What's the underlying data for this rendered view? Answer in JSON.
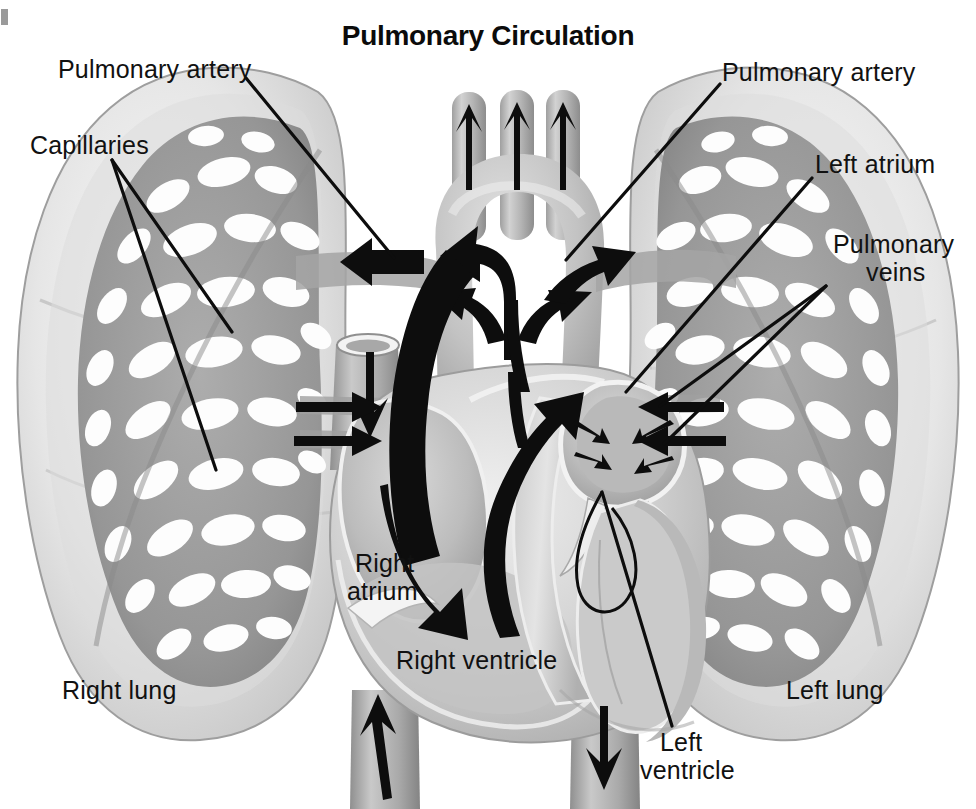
{
  "figure": {
    "title": "Pulmonary Circulation",
    "type": "anatomical-illustration",
    "style": "grayscale airbrush medical illustration",
    "background_color": "#ffffff",
    "ink_color": "#111111"
  },
  "labels": {
    "pulmonary_artery_left": "Pulmonary artery",
    "capillaries": "Capillaries",
    "right_lung": "Right lung",
    "right_atrium_line1": "Right",
    "right_atrium_line2": "atrium",
    "right_ventricle": "Right ventricle",
    "pulmonary_artery_right": "Pulmonary artery",
    "left_atrium": "Left atrium",
    "pulmonary_veins_line1": "Pulmonary",
    "pulmonary_veins_line2": "veins",
    "left_lung": "Left lung",
    "left_ventricle_line1": "Left",
    "left_ventricle_line2": "ventricle"
  },
  "structures": {
    "aortic_arch": "aortic arch",
    "brachiocephalic_branches": "three aortic arch branch vessels",
    "superior_vena_cava": "superior vena cava",
    "inferior_vena_cava": "inferior vena cava",
    "descending_aorta": "descending aorta",
    "pulmonary_trunk": "pulmonary trunk",
    "interventricular_septum": "interventricular septum",
    "right_lung_capillary_bed": "right lung capillary network",
    "left_lung_capillary_bed": "left lung capillary network"
  },
  "flow_arrows": [
    {
      "name": "aortic-branch-arrow-1",
      "direction": "up",
      "meaning": "blood to head and arms"
    },
    {
      "name": "aortic-branch-arrow-2",
      "direction": "up",
      "meaning": "blood to head and arms"
    },
    {
      "name": "aortic-branch-arrow-3",
      "direction": "up",
      "meaning": "blood to head and arms"
    },
    {
      "name": "superior-vena-cava-arrow",
      "direction": "down",
      "meaning": "deoxygenated blood into right atrium"
    },
    {
      "name": "inferior-vena-cava-arrow",
      "direction": "up",
      "meaning": "deoxygenated blood into right atrium"
    },
    {
      "name": "descending-aorta-arrow",
      "direction": "down",
      "meaning": "oxygenated blood to body"
    },
    {
      "name": "right-atrium-arrow",
      "direction": "down-right",
      "meaning": "right atrium to right ventricle"
    },
    {
      "name": "right-ventricle-outflow-arrow",
      "direction": "up",
      "meaning": "right ventricle to pulmonary trunk"
    },
    {
      "name": "pulmonary-trunk-split-arrow",
      "direction": "y-split",
      "meaning": "pulmonary trunk branching to both lungs"
    },
    {
      "name": "right-pulmonary-artery-arrow",
      "direction": "left",
      "meaning": "to right lung"
    },
    {
      "name": "left-pulmonary-artery-arrow",
      "direction": "up-right",
      "meaning": "to left lung"
    },
    {
      "name": "pulmonary-vein-arrow-right-upper",
      "direction": "right",
      "meaning": "oxygenated blood from right lung"
    },
    {
      "name": "pulmonary-vein-arrow-right-lower",
      "direction": "right",
      "meaning": "oxygenated blood from right lung"
    },
    {
      "name": "pulmonary-vein-arrow-left-upper",
      "direction": "left",
      "meaning": "oxygenated blood from left lung"
    },
    {
      "name": "pulmonary-vein-arrow-left-lower",
      "direction": "left",
      "meaning": "oxygenated blood from left lung"
    },
    {
      "name": "left-atrium-converging-arrow-1",
      "direction": "inward",
      "meaning": "into left atrium"
    },
    {
      "name": "left-atrium-converging-arrow-2",
      "direction": "inward",
      "meaning": "into left atrium"
    },
    {
      "name": "left-atrium-converging-arrow-3",
      "direction": "inward",
      "meaning": "into left atrium"
    },
    {
      "name": "left-atrium-converging-arrow-4",
      "direction": "inward",
      "meaning": "into left atrium"
    }
  ],
  "palette": {
    "ink": "#111111",
    "lung_outer": "#e8e8e8",
    "lung_mid": "#cfcfcf",
    "capillary_mesh": "#9b9b9b",
    "heart_wall_light": "#e3e3e3",
    "heart_wall_mid": "#bdbdbd",
    "heart_chamber": "#c6c6c6",
    "vessel_gray": "#b6b6b6",
    "vessel_dark": "#8f8f8f",
    "white": "#ffffff"
  }
}
